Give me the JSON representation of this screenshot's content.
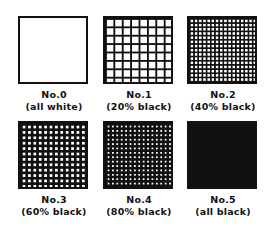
{
  "title": "",
  "swatches": [
    {
      "number": "No.0",
      "description": "(all white)",
      "black_percent": 0,
      "pitch": 0,
      "line": 0
    },
    {
      "number": "No.1",
      "description": "(20% black)",
      "black_percent": 20,
      "pitch": 8.4,
      "line": 1.8
    },
    {
      "number": "No.2",
      "description": "(40% black)",
      "black_percent": 40,
      "pitch": 4.2,
      "line": 1.6
    },
    {
      "number": "No.3",
      "description": "(60% black)",
      "black_percent": 60,
      "pitch": 5.4,
      "line": 2.4
    },
    {
      "number": "No.4",
      "description": "(80% black)",
      "black_percent": 80,
      "pitch": 4.4,
      "line": 2.6
    },
    {
      "number": "No.5",
      "description": "(all black)",
      "black_percent": 100,
      "pitch": 0,
      "line": 0
    }
  ],
  "colors": {
    "ink": "#111111",
    "paper": "#ffffff"
  }
}
